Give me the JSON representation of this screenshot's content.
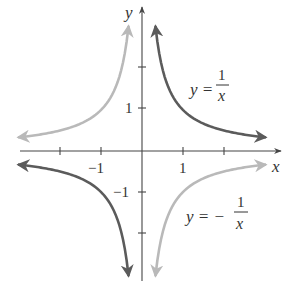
{
  "chart_data": {
    "type": "line",
    "title": "",
    "xlabel": "x",
    "ylabel": "y",
    "xlim": [
      -3.3,
      3.3
    ],
    "ylim": [
      -3.2,
      3.4
    ],
    "grid": false,
    "legend": "none (inline curve labels)",
    "x_ticks": [
      -2,
      -1,
      1,
      2
    ],
    "x_tick_labels": [
      {
        "value": -1,
        "label": "−1"
      },
      {
        "value": 1,
        "label": "1"
      }
    ],
    "y_ticks": [
      -2,
      -1,
      1,
      2
    ],
    "y_tick_labels": [
      {
        "value": 1,
        "label": "1"
      },
      {
        "value": -1,
        "label": "−1"
      }
    ],
    "series": [
      {
        "name": "y = 1/x",
        "label_text": {
          "lhs": "y =",
          "numerator": "1",
          "denominator": "x"
        },
        "color": "#5b5b5b",
        "branches": [
          {
            "x_range": [
              0.33,
              3.0
            ],
            "formula": "1/x"
          },
          {
            "x_range": [
              -3.0,
              -0.33
            ],
            "formula": "1/x"
          }
        ],
        "sample_points": [
          [
            0.33,
            3.03
          ],
          [
            0.5,
            2.0
          ],
          [
            1,
            1
          ],
          [
            2,
            0.5
          ],
          [
            3,
            0.33
          ],
          [
            -0.33,
            -3.03
          ],
          [
            -0.5,
            -2.0
          ],
          [
            -1,
            -1
          ],
          [
            -2,
            -0.5
          ],
          [
            -3,
            -0.33
          ]
        ]
      },
      {
        "name": "y = −1/x",
        "label_text": {
          "lhs": "y = −",
          "numerator": "1",
          "denominator": "x"
        },
        "color": "#b9b9b9",
        "branches": [
          {
            "x_range": [
              -3.0,
              -0.33
            ],
            "formula": "-1/x"
          },
          {
            "x_range": [
              0.33,
              3.0
            ],
            "formula": "-1/x"
          }
        ],
        "sample_points": [
          [
            -0.33,
            3.03
          ],
          [
            -0.5,
            2.0
          ],
          [
            -1,
            1
          ],
          [
            -2,
            0.5
          ],
          [
            -3,
            0.33
          ],
          [
            0.33,
            -3.03
          ],
          [
            0.5,
            -2.0
          ],
          [
            1,
            -1
          ],
          [
            2,
            -0.5
          ],
          [
            3,
            -0.33
          ]
        ]
      }
    ]
  },
  "layout": {
    "origin_px": [
      142,
      151
    ],
    "unit_px": 41,
    "axis_color": "#444444"
  }
}
